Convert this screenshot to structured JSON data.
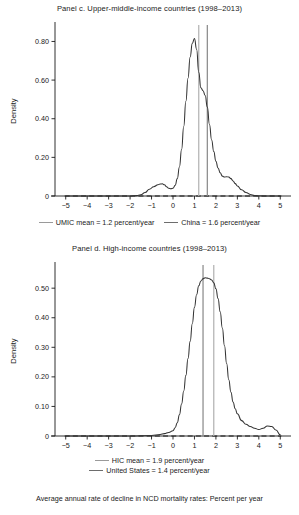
{
  "figure": {
    "caption": "Average annual rate of decline in NCD mortality rates: Percent per year",
    "colors": {
      "curve": "#333333",
      "zero_line": "#1a1a1a",
      "mean_line_light": "#b3b3b3",
      "mean_line_dark": "#8c8c8c",
      "axis": "#1a1a1a",
      "background": "#ffffff"
    }
  },
  "panels": [
    {
      "id": "panel-c",
      "title": "Panel c. Upper-middle-income countries (1998–2013)",
      "legend": [
        {
          "label": "UMIC mean = 1.2 percent/year",
          "color": "#b3b3b3"
        },
        {
          "label": "China = 1.6 percent/year",
          "color": "#8c8c8c"
        }
      ]
    },
    {
      "id": "panel-d",
      "title": "Panel d. High-income countries (1998–2013)",
      "legend": [
        {
          "label": "HIC mean = 1.9 percent/year",
          "color": "#b3b3b3"
        },
        {
          "label": "United States = 1.4 percent/year",
          "color": "#8c8c8c"
        }
      ]
    }
  ],
  "chart_data": [
    {
      "type": "line",
      "id": "panel-c",
      "title": "Panel c. Upper-middle-income countries (1998–2013)",
      "xlabel": "",
      "ylabel": "Density",
      "xlim": [
        -5.5,
        5.5
      ],
      "ylim": [
        0,
        0.88
      ],
      "xticks": [
        -5,
        -4,
        -3,
        -2,
        -1,
        0,
        1,
        2,
        3,
        4,
        5
      ],
      "xticklabels": [
        "−5",
        "−4",
        "−3",
        "−2",
        "−1",
        "0",
        "1",
        "2",
        "3",
        "4",
        "5"
      ],
      "yticks": [
        0,
        0.2,
        0.4,
        0.6,
        0.8
      ],
      "yticklabels": [
        "0",
        "0.20",
        "0.40",
        "0.60",
        "0.80"
      ],
      "grid": false,
      "legend_position": "below",
      "series": [
        {
          "name": "UMIC kernel density",
          "x": [
            -5.0,
            -4.5,
            -4.0,
            -3.5,
            -3.0,
            -2.5,
            -2.0,
            -1.7,
            -1.5,
            -1.3,
            -1.1,
            -0.9,
            -0.7,
            -0.6,
            -0.5,
            -0.4,
            -0.3,
            -0.2,
            -0.1,
            0.0,
            0.1,
            0.2,
            0.3,
            0.4,
            0.5,
            0.6,
            0.7,
            0.8,
            0.9,
            1.0,
            1.1,
            1.2,
            1.3,
            1.4,
            1.5,
            1.6,
            1.7,
            1.8,
            1.9,
            2.0,
            2.1,
            2.2,
            2.3,
            2.4,
            2.5,
            2.6,
            2.7,
            2.8,
            2.9,
            3.0,
            3.2,
            3.4,
            3.6,
            3.8,
            4.0,
            4.5,
            5.0
          ],
          "y": [
            0.0,
            0.0,
            0.0,
            0.0,
            0.0,
            0.0,
            0.0,
            0.002,
            0.006,
            0.018,
            0.035,
            0.048,
            0.058,
            0.062,
            0.063,
            0.058,
            0.048,
            0.04,
            0.038,
            0.04,
            0.055,
            0.09,
            0.15,
            0.24,
            0.36,
            0.49,
            0.61,
            0.72,
            0.79,
            0.815,
            0.76,
            0.64,
            0.56,
            0.545,
            0.52,
            0.46,
            0.37,
            0.29,
            0.23,
            0.18,
            0.145,
            0.12,
            0.103,
            0.098,
            0.1,
            0.098,
            0.09,
            0.078,
            0.064,
            0.052,
            0.032,
            0.018,
            0.008,
            0.003,
            0.001,
            0.0,
            0.0
          ]
        }
      ],
      "annotations": [
        {
          "name": "umic-mean-line",
          "x": 1.2,
          "label": "UMIC mean = 1.2 percent/year",
          "color": "#b3b3b3"
        },
        {
          "name": "china-line",
          "x": 1.6,
          "label": "China = 1.6 percent/year",
          "color": "#8c8c8c"
        }
      ]
    },
    {
      "type": "line",
      "id": "panel-d",
      "title": "Panel d. High-income countries (1998–2013)",
      "xlabel": "",
      "ylabel": "Density",
      "xlim": [
        -5.5,
        5.5
      ],
      "ylim": [
        0,
        0.575
      ],
      "xticks": [
        -5,
        -4,
        -3,
        -2,
        -1,
        0,
        1,
        2,
        3,
        4,
        5
      ],
      "xticklabels": [
        "−5",
        "−4",
        "−3",
        "−2",
        "−1",
        "0",
        "1",
        "2",
        "3",
        "4",
        "5"
      ],
      "yticks": [
        0,
        0.1,
        0.2,
        0.3,
        0.4,
        0.5
      ],
      "yticklabels": [
        "0",
        "0.10",
        "0.20",
        "0.30",
        "0.40",
        "0.50"
      ],
      "grid": false,
      "legend_position": "below",
      "series": [
        {
          "name": "HIC kernel density",
          "x": [
            -5.0,
            -4.0,
            -3.0,
            -2.0,
            -1.0,
            -0.6,
            -0.4,
            -0.2,
            0.0,
            0.1,
            0.2,
            0.3,
            0.4,
            0.5,
            0.6,
            0.7,
            0.8,
            0.9,
            1.0,
            1.1,
            1.2,
            1.3,
            1.4,
            1.5,
            1.6,
            1.7,
            1.8,
            1.9,
            2.0,
            2.1,
            2.2,
            2.3,
            2.4,
            2.5,
            2.6,
            2.7,
            2.8,
            2.9,
            3.0,
            3.2,
            3.4,
            3.6,
            3.8,
            4.0,
            4.2,
            4.4,
            4.6,
            4.8,
            5.0
          ],
          "y": [
            0.0,
            0.0,
            0.0,
            0.0,
            0.002,
            0.005,
            0.008,
            0.012,
            0.018,
            0.028,
            0.045,
            0.072,
            0.108,
            0.152,
            0.205,
            0.262,
            0.32,
            0.38,
            0.435,
            0.478,
            0.508,
            0.524,
            0.532,
            0.535,
            0.534,
            0.532,
            0.528,
            0.518,
            0.498,
            0.465,
            0.42,
            0.365,
            0.305,
            0.245,
            0.19,
            0.148,
            0.115,
            0.092,
            0.075,
            0.052,
            0.04,
            0.032,
            0.026,
            0.022,
            0.026,
            0.034,
            0.032,
            0.02,
            0.004
          ]
        }
      ],
      "annotations": [
        {
          "name": "hic-mean-line",
          "x": 1.9,
          "label": "HIC mean = 1.9 percent/year",
          "color": "#b3b3b3"
        },
        {
          "name": "united-states-line",
          "x": 1.4,
          "label": "United States = 1.4 percent/year",
          "color": "#8c8c8c"
        }
      ]
    }
  ]
}
